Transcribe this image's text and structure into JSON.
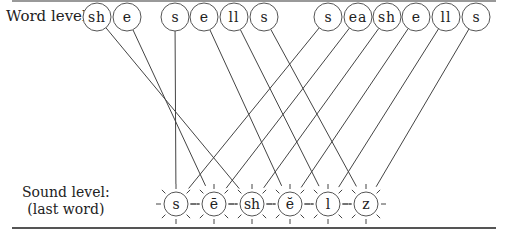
{
  "labels": {
    "word_level": "Word level:",
    "sound_level_line1": "Sound level:",
    "sound_level_line2": "(last word)"
  },
  "word_nodes": [
    {
      "text": "sh",
      "x": 97
    },
    {
      "text": "e",
      "x": 127
    },
    {
      "text": "s",
      "x": 175
    },
    {
      "text": "e",
      "x": 204
    },
    {
      "text": "ll",
      "x": 234
    },
    {
      "text": "s",
      "x": 264
    },
    {
      "text": "s",
      "x": 328
    },
    {
      "text": "ea",
      "x": 358
    },
    {
      "text": "sh",
      "x": 387
    },
    {
      "text": "e",
      "x": 416
    },
    {
      "text": "ll",
      "x": 446
    },
    {
      "text": "s",
      "x": 476
    }
  ],
  "sound_nodes": [
    {
      "text": "s",
      "x": 176
    },
    {
      "text": "ē",
      "x": 214
    },
    {
      "text": "sh",
      "x": 252
    },
    {
      "text": "ĕ",
      "x": 290
    },
    {
      "text": "l",
      "x": 328
    },
    {
      "text": "z",
      "x": 366
    }
  ],
  "connections": [
    [
      0,
      2
    ],
    [
      1,
      1
    ],
    [
      2,
      0
    ],
    [
      3,
      3
    ],
    [
      4,
      4
    ],
    [
      5,
      5
    ],
    [
      6,
      0
    ],
    [
      7,
      1
    ],
    [
      8,
      2
    ],
    [
      9,
      3
    ],
    [
      10,
      4
    ],
    [
      11,
      5
    ]
  ]
}
